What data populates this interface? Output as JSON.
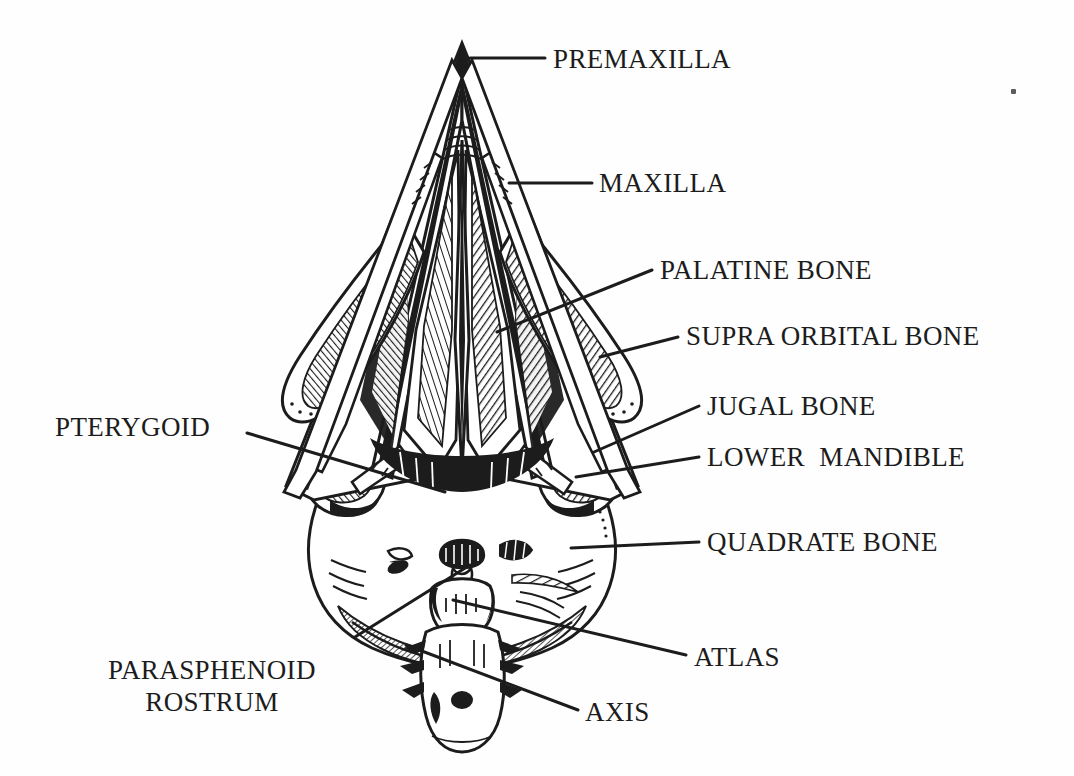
{
  "figure": {
    "background_color": "#ffffff",
    "ink_color": "#1c1c1c",
    "width": 1074,
    "height": 776
  },
  "labels": [
    {
      "id": "premaxilla",
      "text": "PREMAXILLA",
      "x": 553,
      "y": 44,
      "align": "left"
    },
    {
      "id": "maxilla",
      "text": "MAXILLA",
      "x": 599,
      "y": 168,
      "align": "left"
    },
    {
      "id": "palatine-bone",
      "text": "PALATINE BONE",
      "x": 660,
      "y": 255,
      "align": "left"
    },
    {
      "id": "supra-orbital-bone",
      "text": "SUPRA ORBITAL BONE",
      "x": 686,
      "y": 321,
      "align": "left"
    },
    {
      "id": "jugal-bone",
      "text": "JUGAL BONE",
      "x": 707,
      "y": 391,
      "align": "left"
    },
    {
      "id": "lower-mandible",
      "text": "LOWER  MANDIBLE",
      "x": 707,
      "y": 442,
      "align": "left"
    },
    {
      "id": "quadrate-bone",
      "text": "QUADRATE BONE",
      "x": 707,
      "y": 527,
      "align": "left"
    },
    {
      "id": "pterygoid",
      "text": "PTERYGOID",
      "x": 55,
      "y": 412,
      "align": "left"
    },
    {
      "id": "atlas",
      "text": "ATLAS",
      "x": 694,
      "y": 642,
      "align": "left"
    },
    {
      "id": "axis",
      "text": "AXIS",
      "x": 585,
      "y": 697,
      "align": "left"
    },
    {
      "id": "parasphenoid-rostrum",
      "text": "PARASPHENOID\nROSTRUM",
      "x": 108,
      "y": 655,
      "align": "center"
    }
  ],
  "leaders": [
    {
      "id": "leader-premaxilla",
      "points": "470,58 545,58"
    },
    {
      "id": "leader-maxilla",
      "points": "509,183 592,183"
    },
    {
      "id": "leader-palatine-bone",
      "points": "497,332 652,270"
    },
    {
      "id": "leader-supra-orbital-bone",
      "points": "600,357 678,337"
    },
    {
      "id": "leader-jugal-bone",
      "points": "594,452 699,406"
    },
    {
      "id": "leader-lower-mandible",
      "points": "576,477 699,457"
    },
    {
      "id": "leader-quadrate-bone",
      "points": "571,548 699,542"
    },
    {
      "id": "leader-pterygoid",
      "points": "247,433 445,492"
    },
    {
      "id": "leader-atlas",
      "points": "453,600 686,655"
    },
    {
      "id": "leader-axis",
      "points": "406,645 578,710"
    },
    {
      "id": "leader-parasphenoid-rostrum",
      "points": "355,637 470,565"
    }
  ],
  "artifacts": [
    {
      "id": "scan-speck",
      "x": 1011,
      "y": 89
    }
  ]
}
